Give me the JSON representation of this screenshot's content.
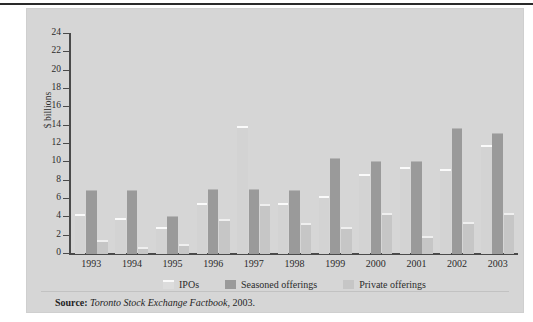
{
  "figure": {
    "background_color": "#d6d6d6",
    "page_color": "#ffffff"
  },
  "axis": {
    "ylabel": "$ billions",
    "ticks": [
      "24",
      "22",
      "20",
      "18",
      "16",
      "14",
      "12",
      "10",
      "8",
      "6",
      "4",
      "2",
      "0"
    ]
  },
  "legend": {
    "items": [
      {
        "label": "IPOs",
        "color": "#dcdcdc",
        "key": "ipo"
      },
      {
        "label": "Seasoned offerings",
        "color": "#9a9a9a",
        "key": "seasoned"
      },
      {
        "label": "Private offerings",
        "color": "#c6c6c6",
        "key": "private"
      }
    ]
  },
  "source": {
    "prefix": "Source:",
    "title": "Toronto Stock Exchange Factbook",
    "suffix": ", 2003."
  },
  "chart_data": {
    "type": "bar",
    "title": "",
    "xlabel": "",
    "ylabel": "$ billions",
    "ylim": [
      0,
      24
    ],
    "ytick_step": 2,
    "grid": false,
    "legend_position": "bottom",
    "categories": [
      "1993",
      "1994",
      "1995",
      "1996",
      "1997",
      "1998",
      "1999",
      "2000",
      "2001",
      "2002",
      "2003"
    ],
    "series": [
      {
        "name": "IPOs",
        "color": "#dcdcdc",
        "values": [
          4.4,
          3.9,
          2.9,
          5.6,
          14.0,
          5.6,
          6.3,
          8.7,
          9.5,
          9.3,
          11.9
        ]
      },
      {
        "name": "Seasoned offerings",
        "color": "#9a9a9a",
        "values": [
          7.0,
          7.0,
          4.2,
          7.1,
          7.1,
          7.0,
          10.5,
          10.2,
          10.2,
          13.8,
          13.2
        ]
      },
      {
        "name": "Private offerings",
        "color": "#c6c6c6",
        "values": [
          1.5,
          0.8,
          1.1,
          3.8,
          5.5,
          3.4,
          3.0,
          4.5,
          2.0,
          3.5,
          4.5
        ]
      }
    ]
  }
}
